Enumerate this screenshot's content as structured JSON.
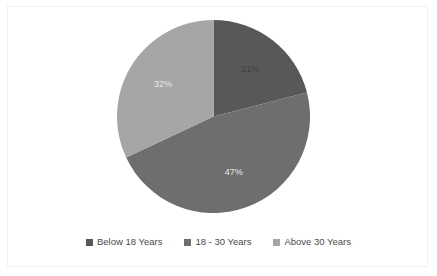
{
  "chart_data": {
    "type": "pie",
    "title": "",
    "categories": [
      "Below 18 Years",
      "18 - 30 Years",
      "Above 30 Years"
    ],
    "values": [
      21,
      47,
      32
    ],
    "labels": [
      "21%",
      "47%",
      "32%"
    ],
    "colors": [
      "#585858",
      "#6e6e6e",
      "#a6a6a6"
    ],
    "legend_position": "bottom",
    "grid": false,
    "xlabel": "",
    "ylabel": "",
    "start_angle_deg": 0,
    "direction": "clockwise",
    "slices": [
      {
        "name": "Below 18 Years",
        "value": 21,
        "label": "21%",
        "color": "#585858",
        "label_color": "#3f3f3f"
      },
      {
        "name": "18 - 30 Years",
        "value": 47,
        "label": "47%",
        "color": "#6e6e6e",
        "label_color": "#e8e8e8"
      },
      {
        "name": "Above 30 Years",
        "value": 32,
        "label": "32%",
        "color": "#a6a6a6",
        "label_color": "#e8e8e8"
      }
    ]
  },
  "legend": {
    "items": [
      {
        "label": "Below 18 Years",
        "color": "#585858"
      },
      {
        "label": "18 - 30 Years",
        "color": "#6e6e6e"
      },
      {
        "label": "Above 30 Years",
        "color": "#a6a6a6"
      }
    ]
  },
  "frame": {
    "background": "#ffffff",
    "border_color": "#f2f2f2"
  }
}
